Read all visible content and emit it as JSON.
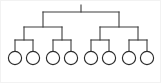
{
  "diagram": {
    "type": "tree",
    "orientation": "top-down",
    "levels": 4,
    "leaf_count": 8,
    "style": {
      "background": "#ffffff",
      "border_color": "#f2f2f2",
      "line_color": "#3c3c3c",
      "node_stroke": "#2b2b2b",
      "node_fill": "#ffffff",
      "line_width": 1.1,
      "node_radius": 6.6
    },
    "geometry": {
      "root": {
        "x": 80,
        "y": 11
      },
      "level1_bar": {
        "y": 11,
        "x1": 42,
        "x2": 118
      },
      "level1_nodes": [
        {
          "x": 42,
          "y": 26
        },
        {
          "x": 118,
          "y": 26
        }
      ],
      "level2_bars": [
        {
          "y": 26,
          "x1": 23,
          "x2": 61
        },
        {
          "y": 26,
          "x1": 99,
          "x2": 137
        }
      ],
      "level2_nodes": [
        {
          "x": 23,
          "y": 39
        },
        {
          "x": 61,
          "y": 39
        },
        {
          "x": 99,
          "y": 39
        },
        {
          "x": 137,
          "y": 39
        }
      ],
      "level3_bars": [
        {
          "y": 39,
          "x1": 14,
          "x2": 32
        },
        {
          "y": 39,
          "x1": 52,
          "x2": 70
        },
        {
          "y": 39,
          "x1": 90,
          "x2": 108
        },
        {
          "y": 39,
          "x1": 128,
          "x2": 146
        }
      ],
      "leaf_centers_y": 57,
      "leaf_centers_x": [
        14,
        32,
        52,
        70,
        90,
        108,
        128,
        146
      ]
    },
    "leaves": [
      {
        "id": "leaf-1",
        "label": ""
      },
      {
        "id": "leaf-2",
        "label": ""
      },
      {
        "id": "leaf-3",
        "label": ""
      },
      {
        "id": "leaf-4",
        "label": ""
      },
      {
        "id": "leaf-5",
        "label": ""
      },
      {
        "id": "leaf-6",
        "label": ""
      },
      {
        "id": "leaf-7",
        "label": ""
      },
      {
        "id": "leaf-8",
        "label": ""
      }
    ]
  }
}
